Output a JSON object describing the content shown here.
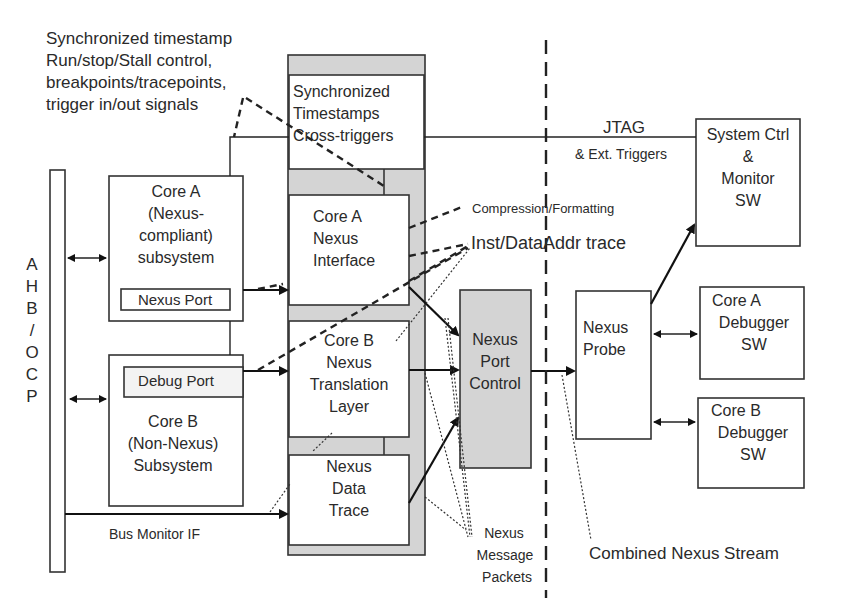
{
  "annotations": {
    "top_left": [
      "Synchronized timestamp",
      "Run/stop/Stall control,",
      "breakpoints/tracepoints,",
      "trigger in/out signals"
    ],
    "compression": "Compression/Formatting",
    "inst_trace": "Inst/DataAddr trace",
    "jtag": "JTAG",
    "ext_triggers": "& Ext. Triggers",
    "bus_monitor": "Bus Monitor IF",
    "message_packets": [
      "Nexus",
      "Message",
      "Packets"
    ],
    "combined_stream": "Combined Nexus Stream"
  },
  "bus": {
    "label": [
      "A",
      "H",
      "B",
      "/",
      "O",
      "C",
      "P"
    ]
  },
  "blocks": {
    "core_a": {
      "lines": [
        "Core A",
        "(Nexus-",
        "compliant)",
        "subsystem"
      ],
      "port": "Nexus Port"
    },
    "core_b": {
      "lines": [
        "Core B",
        "(Non-Nexus)",
        "Subsystem"
      ],
      "port": "Debug Port"
    },
    "sync": {
      "lines": [
        "Synchronized",
        "Timestamps",
        "Cross-triggers"
      ]
    },
    "core_a_nexus": {
      "lines": [
        "Core A",
        "Nexus",
        "Interface"
      ]
    },
    "core_b_nexus": {
      "lines": [
        "Core B",
        "Nexus",
        "Translation",
        "Layer"
      ]
    },
    "data_trace": {
      "lines": [
        "Nexus",
        "Data",
        "Trace"
      ]
    },
    "port_control": {
      "lines": [
        "Nexus",
        "Port",
        "Control"
      ]
    },
    "probe": {
      "lines": [
        "Nexus",
        "Probe"
      ]
    },
    "system_ctrl": {
      "lines": [
        "System Ctrl",
        "&",
        "Monitor",
        "SW"
      ]
    },
    "core_a_dbg": {
      "lines": [
        "Core A",
        "Debugger",
        "SW"
      ]
    },
    "core_b_dbg": {
      "lines": [
        "Core B",
        "Debugger",
        "SW"
      ]
    }
  },
  "colors": {
    "gray_fill": "#d4d4d4",
    "stroke": "#333333",
    "background": "#ffffff"
  }
}
